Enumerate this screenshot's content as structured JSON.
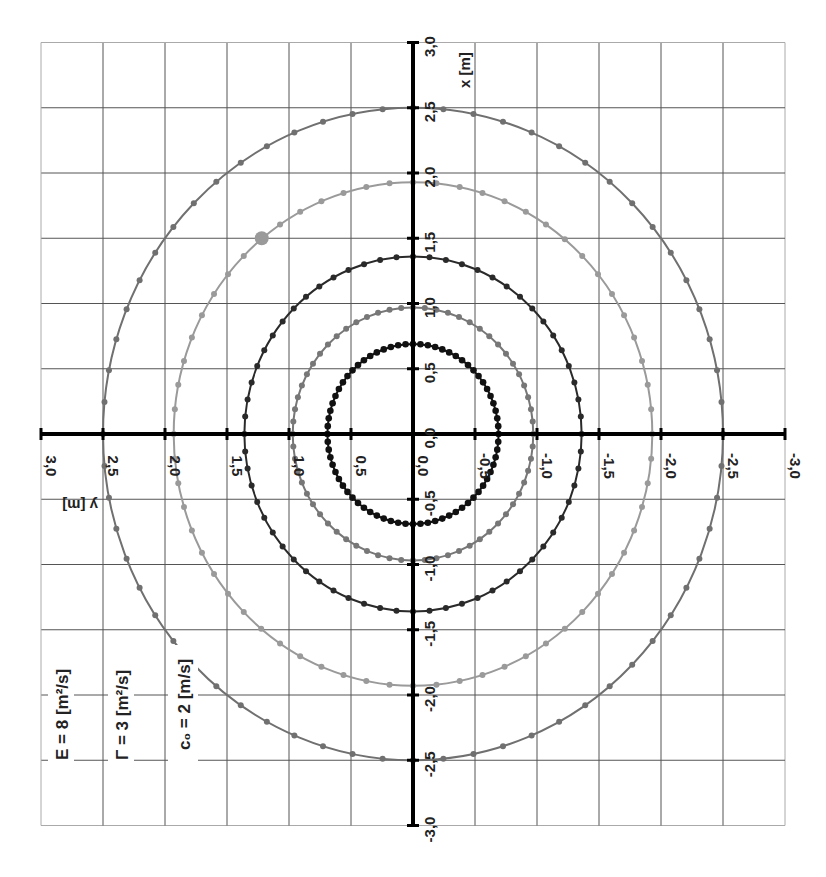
{
  "chart_data": {
    "type": "scatter",
    "title": "",
    "orientation": "rotated 90 degrees clockwise (x axis vertical pointing up, y axis horizontal pointing left)",
    "xlabel": "x [m]",
    "ylabel": "y [m]",
    "xlim": [
      -3.0,
      3.0
    ],
    "ylim": [
      -3.0,
      3.0
    ],
    "grid": true,
    "grid_step": 0.5,
    "x_ticks": [
      "-3,0",
      "-2,5",
      "-2,0",
      "-1,5",
      "-1,0",
      "-0,5",
      "0,0",
      "0,5",
      "1,0",
      "1,5",
      "2,0",
      "2,5",
      "3,0"
    ],
    "y_ticks": [
      "3,0",
      "2,5",
      "2,0",
      "1,5",
      "1,0",
      "0,5",
      "0,0",
      "-0,5",
      "-1,0",
      "-1,5",
      "-2,0",
      "-2,5",
      "-3,0"
    ],
    "tick_values": [
      -3.0,
      -2.5,
      -2.0,
      -1.5,
      -1.0,
      -0.5,
      0.0,
      0.5,
      1.0,
      1.5,
      2.0,
      2.5,
      3.0
    ],
    "series": [
      {
        "name": "circle-1",
        "shape": "circle",
        "radius": 0.69,
        "points": 72,
        "color": "#111111"
      },
      {
        "name": "circle-2",
        "shape": "circle",
        "radius": 0.97,
        "points": 64,
        "color": "#777777"
      },
      {
        "name": "circle-3",
        "shape": "circle",
        "radius": 1.36,
        "points": 64,
        "color": "#2a2a2a"
      },
      {
        "name": "circle-4",
        "shape": "circle",
        "radius": 1.93,
        "points": 64,
        "color": "#9a9a9a"
      },
      {
        "name": "circle-5",
        "shape": "circle",
        "radius": 2.5,
        "points": 64,
        "color": "#707070"
      }
    ],
    "highlight_point": {
      "x": 1.5,
      "y": 1.22,
      "color": "#9a9a9a"
    },
    "annotations": [
      {
        "text": "E = 8 [m²/s]"
      },
      {
        "text": "Γ = 3 [m²/s]"
      },
      {
        "text": "c₀ = 2 [m/s]"
      }
    ]
  }
}
